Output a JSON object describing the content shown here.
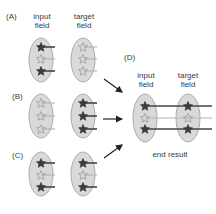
{
  "panels": {
    "A": {
      "label": "(A)",
      "input_label": "input\nfield",
      "target_label": "target\nfield"
    },
    "B": {
      "label": "(B)"
    },
    "C": {
      "label": "(C)"
    },
    "D": {
      "label": "(D)",
      "input_label": "input\nfield",
      "target_label": "target\nfield",
      "caption": "end result"
    }
  },
  "labels": {
    "a_input_1": "input",
    "a_input_2": "field",
    "a_target_1": "target",
    "a_target_2": "field",
    "d_input_1": "input",
    "d_input_2": "field",
    "d_target_1": "target",
    "d_target_2": "field"
  },
  "colors": {
    "ellipse_fill": "#d9d9d9",
    "ellipse_stroke": "#9a9a9a",
    "active_star": "#3d3d3d",
    "inactive_star": "#a0a0a0",
    "active_line": "#444444",
    "inactive_line": "#b5b5b5"
  }
}
